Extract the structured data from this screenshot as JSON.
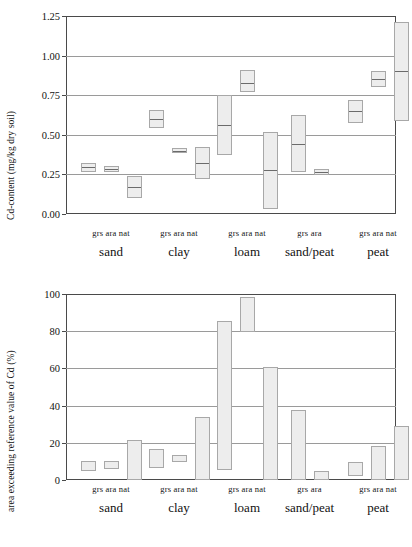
{
  "figure": {
    "panels": [
      {
        "letter": "A",
        "ylabel": "Cd-content (mg/kg dry soil)",
        "yticks": [
          "0.00",
          "0.25",
          "0.50",
          "0.75",
          "1.00",
          "1.25"
        ]
      },
      {
        "letter": "B",
        "ylabel": "area exceeding reference value of Cd (%)",
        "yticks": [
          "0",
          "20",
          "40",
          "60",
          "80",
          "100"
        ]
      }
    ],
    "soil_groups": [
      {
        "name": "sand",
        "uses": [
          "grs",
          "ara",
          "nat"
        ]
      },
      {
        "name": "clay",
        "uses": [
          "grs",
          "ara",
          "nat"
        ]
      },
      {
        "name": "loam",
        "uses": [
          "grs",
          "ara",
          "nat"
        ]
      },
      {
        "name": "sand/peat",
        "uses": [
          "grs",
          "ara"
        ]
      },
      {
        "name": "peat",
        "uses": [
          "grs",
          "ara",
          "nat"
        ]
      }
    ]
  },
  "chart_data": [
    {
      "type": "bar",
      "title": "A",
      "subtype": "floating-box-with-median",
      "xlabel": "",
      "ylabel": "Cd-content (mg/kg dry soil)",
      "ylim": [
        0.0,
        1.25
      ],
      "yticks": [
        0.0,
        0.25,
        0.5,
        0.75,
        1.0,
        1.25
      ],
      "grid": true,
      "legend": "none",
      "categories": [
        "sand grs",
        "sand ara",
        "sand nat",
        "clay grs",
        "clay ara",
        "clay nat",
        "loam grs",
        "loam ara",
        "loam nat",
        "sand/peat grs",
        "sand/peat ara",
        "peat grs",
        "peat ara",
        "peat nat"
      ],
      "boxes": [
        {
          "group": "sand",
          "use": "grs",
          "low": 0.265,
          "high": 0.325,
          "median": 0.295
        },
        {
          "group": "sand",
          "use": "ara",
          "low": 0.265,
          "high": 0.3,
          "median": 0.285
        },
        {
          "group": "sand",
          "use": "nat",
          "low": 0.1,
          "high": 0.24,
          "median": 0.17
        },
        {
          "group": "clay",
          "use": "grs",
          "low": 0.545,
          "high": 0.655,
          "median": 0.6
        },
        {
          "group": "clay",
          "use": "ara",
          "low": 0.385,
          "high": 0.415,
          "median": 0.4
        },
        {
          "group": "clay",
          "use": "nat",
          "low": 0.22,
          "high": 0.42,
          "median": 0.32
        },
        {
          "group": "loam",
          "use": "grs",
          "low": 0.375,
          "high": 0.75,
          "median": 0.56
        },
        {
          "group": "loam",
          "use": "ara",
          "low": 0.77,
          "high": 0.91,
          "median": 0.83
        },
        {
          "group": "loam",
          "use": "nat",
          "low": 0.03,
          "high": 0.515,
          "median": 0.275
        },
        {
          "group": "sand/peat",
          "use": "grs",
          "low": 0.265,
          "high": 0.625,
          "median": 0.445
        },
        {
          "group": "sand/peat",
          "use": "ara",
          "low": 0.245,
          "high": 0.285,
          "median": 0.265
        },
        {
          "group": "peat",
          "use": "grs",
          "low": 0.575,
          "high": 0.72,
          "median": 0.65
        },
        {
          "group": "peat",
          "use": "ara",
          "low": 0.8,
          "high": 0.9,
          "median": 0.855
        },
        {
          "group": "peat",
          "use": "nat",
          "low": 0.59,
          "high": 1.21,
          "median": 0.9
        }
      ]
    },
    {
      "type": "bar",
      "title": "B",
      "subtype": "floating-range-bar",
      "xlabel": "",
      "ylabel": "area exceeding reference value of Cd (%)",
      "ylim": [
        0,
        100
      ],
      "yticks": [
        0,
        20,
        40,
        60,
        80,
        100
      ],
      "grid": true,
      "legend": "none",
      "categories": [
        "sand grs",
        "sand ara",
        "sand nat",
        "clay grs",
        "clay ara",
        "clay nat",
        "loam grs",
        "loam ara",
        "loam nat",
        "sand/peat grs",
        "sand/peat ara",
        "peat grs",
        "peat ara",
        "peat nat"
      ],
      "bars": [
        {
          "group": "sand",
          "use": "grs",
          "low": 5.0,
          "high": 10.0
        },
        {
          "group": "sand",
          "use": "ara",
          "low": 6.0,
          "high": 10.0
        },
        {
          "group": "sand",
          "use": "nat",
          "low": 0.0,
          "high": 21.5
        },
        {
          "group": "clay",
          "use": "grs",
          "low": 6.5,
          "high": 16.5
        },
        {
          "group": "clay",
          "use": "ara",
          "low": 9.5,
          "high": 13.5
        },
        {
          "group": "clay",
          "use": "nat",
          "low": 0.0,
          "high": 34.0
        },
        {
          "group": "loam",
          "use": "grs",
          "low": 5.5,
          "high": 85.5
        },
        {
          "group": "loam",
          "use": "ara",
          "low": 79.5,
          "high": 98.5
        },
        {
          "group": "loam",
          "use": "nat",
          "low": 0.0,
          "high": 60.5
        },
        {
          "group": "sand/peat",
          "use": "grs",
          "low": 0.0,
          "high": 37.5
        },
        {
          "group": "sand/peat",
          "use": "ara",
          "low": 0.0,
          "high": 5.0
        },
        {
          "group": "peat",
          "use": "grs",
          "low": 2.0,
          "high": 9.5
        },
        {
          "group": "peat",
          "use": "ara",
          "low": 0.0,
          "high": 18.5
        },
        {
          "group": "peat",
          "use": "nat",
          "low": 0.0,
          "high": 29.0
        }
      ]
    }
  ]
}
